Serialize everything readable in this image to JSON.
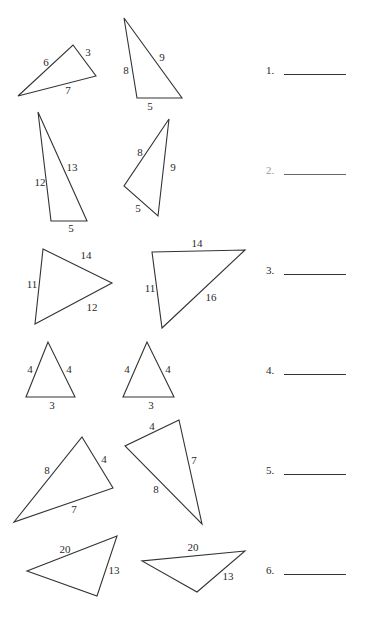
{
  "worksheet": {
    "problems": [
      {
        "number": "1.",
        "top": 62,
        "triangles": [
          {
            "points": "18,96 73,45 96,76",
            "labels": [
              {
                "text": "6",
                "x": 46,
                "y": 62
              },
              {
                "text": "3",
                "x": 88,
                "y": 52
              },
              {
                "text": "7",
                "x": 68,
                "y": 90
              }
            ]
          },
          {
            "points": "124,18 137,98 182,98",
            "labels": [
              {
                "text": "8",
                "x": 126,
                "y": 70
              },
              {
                "text": "9",
                "x": 162,
                "y": 57
              },
              {
                "text": "5",
                "x": 150,
                "y": 106
              }
            ]
          }
        ]
      },
      {
        "number": "2.",
        "top": 162,
        "faded": true,
        "triangles": [
          {
            "points": "38,112 51,221 87,221",
            "labels": [
              {
                "text": "12",
                "x": 40,
                "y": 182
              },
              {
                "text": "13",
                "x": 72,
                "y": 167
              },
              {
                "text": "5",
                "x": 71,
                "y": 228
              }
            ]
          },
          {
            "points": "169,119 124,186 158,216",
            "labels": [
              {
                "text": "8",
                "x": 140,
                "y": 152
              },
              {
                "text": "9",
                "x": 173,
                "y": 167
              },
              {
                "text": "5",
                "x": 138,
                "y": 208
              }
            ]
          }
        ]
      },
      {
        "number": "3.",
        "top": 262,
        "triangles": [
          {
            "points": "43,249 112,283 35,324",
            "labels": [
              {
                "text": "14",
                "x": 86,
                "y": 255
              },
              {
                "text": "11",
                "x": 32,
                "y": 284
              },
              {
                "text": "12",
                "x": 92,
                "y": 307
              }
            ]
          },
          {
            "points": "152,252 245,250 162,328",
            "labels": [
              {
                "text": "14",
                "x": 197,
                "y": 243
              },
              {
                "text": "11",
                "x": 150,
                "y": 288
              },
              {
                "text": "16",
                "x": 211,
                "y": 297
              }
            ]
          }
        ]
      },
      {
        "number": "4.",
        "top": 362,
        "triangles": [
          {
            "points": "48,342 26,397 75,397",
            "labels": [
              {
                "text": "4",
                "x": 30,
                "y": 369
              },
              {
                "text": "4",
                "x": 69,
                "y": 369
              },
              {
                "text": "3",
                "x": 52,
                "y": 405
              }
            ]
          },
          {
            "points": "147,342 123,397 174,397",
            "labels": [
              {
                "text": "4",
                "x": 127,
                "y": 369
              },
              {
                "text": "4",
                "x": 168,
                "y": 369
              },
              {
                "text": "3",
                "x": 151,
                "y": 405
              }
            ]
          }
        ]
      },
      {
        "number": "5.",
        "top": 462,
        "triangles": [
          {
            "points": "82,437 113,488 14,522",
            "labels": [
              {
                "text": "8",
                "x": 47,
                "y": 470
              },
              {
                "text": "4",
                "x": 104,
                "y": 459
              },
              {
                "text": "7",
                "x": 74,
                "y": 509
              }
            ]
          },
          {
            "points": "179,420 125,446 202,524",
            "labels": [
              {
                "text": "4",
                "x": 152,
                "y": 426
              },
              {
                "text": "7",
                "x": 194,
                "y": 460
              },
              {
                "text": "8",
                "x": 156,
                "y": 489
              }
            ]
          }
        ]
      },
      {
        "number": "6.",
        "top": 562,
        "triangles": [
          {
            "points": "117,536 27,571 97,596",
            "labels": [
              {
                "text": "20",
                "x": 65,
                "y": 549
              },
              {
                "text": "13",
                "x": 114,
                "y": 570
              }
            ]
          },
          {
            "points": "245,551 142,561 197,592",
            "labels": [
              {
                "text": "20",
                "x": 193,
                "y": 547
              },
              {
                "text": "13",
                "x": 228,
                "y": 576
              }
            ]
          }
        ]
      }
    ]
  }
}
